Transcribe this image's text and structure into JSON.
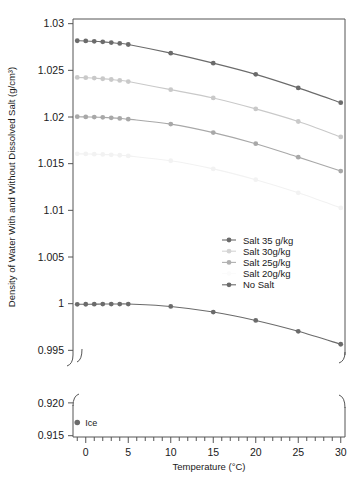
{
  "figure": {
    "background": "#ffffff",
    "axis_color": "#555555",
    "text_color": "#1a1a1a"
  },
  "chart_data": {
    "type": "line",
    "title": "",
    "xlabel": "Temperature (°C)",
    "ylabel": "Density of Water With and Without Dissolved Salt (g/cm³)",
    "xlim": [
      -1.5,
      30.5
    ],
    "xticks": [
      0,
      5,
      10,
      15,
      20,
      25,
      30
    ],
    "xtick_labels": [
      "0",
      "5",
      "10",
      "15",
      "20",
      "25",
      "30"
    ],
    "minor_xtick_step": 1,
    "grid": false,
    "broken_axis": true,
    "panels": [
      {
        "name": "upper",
        "ylim": [
          0.9945,
          1.0305
        ],
        "yticks": [
          0.995,
          1.0,
          1.005,
          1.01,
          1.015,
          1.02,
          1.025,
          1.03
        ],
        "ytick_labels": [
          "0.995",
          "1",
          "1.005",
          "1.01",
          "1.015",
          "1.02",
          "1.025",
          "1.03"
        ]
      },
      {
        "name": "lower",
        "ylim": [
          0.9148,
          0.9212
        ],
        "yticks": [
          0.915,
          0.92
        ],
        "ytick_labels": [
          "0.915",
          "0.920"
        ]
      }
    ],
    "x": [
      -1,
      0,
      1,
      2,
      3,
      4,
      5,
      10,
      15,
      20,
      25,
      30
    ],
    "series": [
      {
        "name": "Salt 35 g/kg",
        "color": "#6b6b6b",
        "panel": "upper",
        "values": [
          1.02817,
          1.02815,
          1.02811,
          1.02805,
          1.02797,
          1.02788,
          1.02777,
          1.02684,
          1.02577,
          1.02457,
          1.02312,
          1.02153
        ]
      },
      {
        "name": "Salt 30g/kg",
        "color": "#c9c9c9",
        "panel": "upper",
        "values": [
          1.02424,
          1.02421,
          1.02417,
          1.0241,
          1.02402,
          1.02392,
          1.0238,
          1.02293,
          1.02204,
          1.02087,
          1.01952,
          1.01786
        ]
      },
      {
        "name": "Salt 25g/kg",
        "color": "#a8a8a8",
        "panel": "upper",
        "values": [
          1.02003,
          1.02001,
          1.01999,
          1.01996,
          1.01991,
          1.01985,
          1.01977,
          1.01924,
          1.01833,
          1.01714,
          1.0157,
          1.01421
        ]
      },
      {
        "name": "Salt 20g/kg",
        "color": "#f2f2f2",
        "panel": "upper",
        "values": [
          1.01605,
          1.01604,
          1.01602,
          1.01599,
          1.01595,
          1.0159,
          1.01583,
          1.01531,
          1.01444,
          1.01328,
          1.01188,
          1.01026
        ]
      },
      {
        "name": "No Salt",
        "color": "#6b6b6b",
        "panel": "upper",
        "values": [
          0.99993,
          0.99994,
          0.99995,
          0.99996,
          0.99996,
          0.99996,
          0.99996,
          0.9997,
          0.9991,
          0.9982,
          0.99704,
          0.99565
        ]
      }
    ],
    "annotations": [
      {
        "label": "Ice",
        "panel": "lower",
        "x": -1,
        "y": 0.917,
        "color": "#6b6b6b"
      }
    ],
    "legend": {
      "position": "center-right",
      "entries": [
        {
          "label": "Salt 35 g/kg",
          "color": "#6b6b6b"
        },
        {
          "label": "Salt 30g/kg",
          "color": "#d4d4d4"
        },
        {
          "label": "Salt 25g/kg",
          "color": "#b0b0b0"
        },
        {
          "label": "Salt 20g/kg",
          "color": "#fbfbfb"
        },
        {
          "label": "No Salt",
          "color": "#6b6b6b"
        }
      ]
    }
  }
}
